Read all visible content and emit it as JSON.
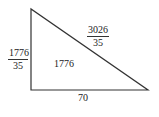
{
  "diagram": {
    "shape": "right-triangle",
    "stroke_color": "#333333",
    "vertices": [
      [
        31,
        9
      ],
      [
        31,
        90
      ],
      [
        148,
        90
      ]
    ],
    "labels": {
      "left_side": {
        "numerator": "1776",
        "denominator": "35"
      },
      "hypotenuse": {
        "numerator": "3026",
        "denominator": "35"
      },
      "area": "1776",
      "base": "70"
    }
  }
}
